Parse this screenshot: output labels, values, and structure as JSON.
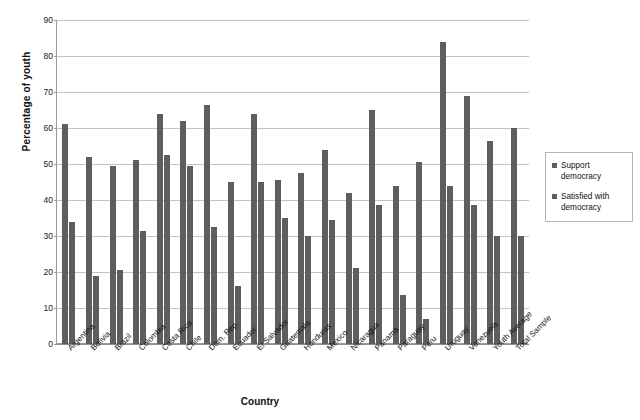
{
  "chart_data": {
    "type": "bar",
    "title": "",
    "xlabel": "Country",
    "ylabel": "Percentage of youth",
    "ylim": [
      0,
      90
    ],
    "ytick_step": 10,
    "yticks": [
      90,
      80,
      70,
      60,
      50,
      40,
      30,
      20,
      10,
      0
    ],
    "grid": true,
    "legend_position": "right",
    "bar_color": "#5e5e5e",
    "categories": [
      "Argentina",
      "Bolivia",
      "Brazil",
      "Colombia",
      "Costa Rica",
      "Chile",
      "Dom. Rep.",
      "Ecuador",
      "El Salvador",
      "Guatemala",
      "Honduras",
      "Mexico",
      "Nicaragua",
      "Panama",
      "Paraguay",
      "Peru",
      "Uruguay",
      "Venezuela",
      "Youth Average",
      "Total Sample"
    ],
    "series": [
      {
        "name": "Support democracy",
        "values": [
          61,
          52,
          49.5,
          51,
          64,
          62,
          66.5,
          45,
          64,
          45.5,
          47.5,
          54,
          42,
          65,
          44,
          50.5,
          84,
          69,
          56.5,
          60
        ]
      },
      {
        "name": "Satisfied with democracy",
        "values": [
          34,
          19,
          20.5,
          31.5,
          52.5,
          49.5,
          32.5,
          16,
          45,
          35,
          30,
          34.5,
          21,
          38.5,
          13.5,
          7,
          44,
          38.5,
          30,
          30
        ]
      }
    ]
  },
  "legend": {
    "items": [
      {
        "label": "Support democracy"
      },
      {
        "label": "Satisfied with democracy"
      }
    ]
  }
}
